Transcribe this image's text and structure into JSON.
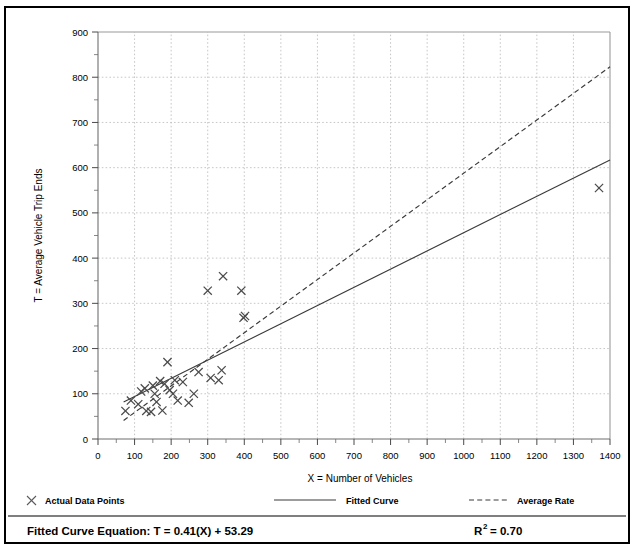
{
  "chart_data": {
    "type": "scatter",
    "title": "",
    "xlabel": "X = Number of Vehicles",
    "ylabel": "T = Average Vehicle Trip Ends",
    "xlim": [
      0,
      1400
    ],
    "ylim": [
      0,
      900
    ],
    "xticks": [
      0,
      100,
      200,
      300,
      400,
      500,
      600,
      700,
      800,
      900,
      1000,
      1100,
      1200,
      1300,
      1400
    ],
    "yticks": [
      0,
      100,
      200,
      300,
      400,
      500,
      600,
      700,
      800,
      900
    ],
    "xtick_labels": [
      "0",
      "100",
      "200",
      "300",
      "400",
      "500",
      "600",
      "700",
      "800",
      "900",
      "1000",
      "1100",
      "1200",
      "1300",
      "1400"
    ],
    "ytick_labels": [
      "0",
      "100",
      "200",
      "300",
      "400",
      "500",
      "600",
      "700",
      "800",
      "900"
    ],
    "x_minor_step": 50,
    "y_minor_step": 50,
    "grid": true,
    "grid_style": "dotted",
    "legend_position": "below-plot",
    "series": [
      {
        "name": "Actual Data Points",
        "type": "scatter",
        "marker": "x",
        "points": [
          [
            75,
            62
          ],
          [
            90,
            85
          ],
          [
            110,
            77
          ],
          [
            118,
            105
          ],
          [
            128,
            112
          ],
          [
            132,
            62
          ],
          [
            145,
            60
          ],
          [
            150,
            118
          ],
          [
            155,
            100
          ],
          [
            160,
            82
          ],
          [
            170,
            128
          ],
          [
            176,
            63
          ],
          [
            182,
            122
          ],
          [
            190,
            170
          ],
          [
            196,
            108
          ],
          [
            205,
            100
          ],
          [
            210,
            130
          ],
          [
            218,
            85
          ],
          [
            232,
            126
          ],
          [
            248,
            80
          ],
          [
            262,
            100
          ],
          [
            275,
            148
          ],
          [
            300,
            328
          ],
          [
            308,
            135
          ],
          [
            330,
            130
          ],
          [
            338,
            152
          ],
          [
            342,
            360
          ],
          [
            392,
            328
          ],
          [
            398,
            268
          ],
          [
            402,
            272
          ],
          [
            1370,
            555
          ]
        ]
      },
      {
        "name": "Fitted Curve",
        "type": "line",
        "style": "solid",
        "equation": "T = 0.41(X) + 53.29",
        "slope": 0.41,
        "intercept": 53.29,
        "x_range": [
          70,
          1400
        ],
        "y_range": [
          82,
          617
        ]
      },
      {
        "name": "Average Rate",
        "type": "line",
        "style": "dashed",
        "slope": 0.588,
        "intercept": 0,
        "x_range": [
          70,
          1400
        ],
        "y_range": [
          41,
          823
        ]
      }
    ],
    "annotations": {
      "equation_label": "Fitted Curve Equation:",
      "equation_value": "T = 0.41(X) + 53.29",
      "r_squared_base": "R",
      "r_squared_exp": "2",
      "r_squared_value": "= 0.70"
    }
  },
  "legend": {
    "items": [
      {
        "label": "Actual Data Points",
        "marker": "x-marker"
      },
      {
        "label": "Fitted Curve",
        "marker": "solid-line"
      },
      {
        "label": "Average Rate",
        "marker": "dashed-line"
      }
    ]
  }
}
